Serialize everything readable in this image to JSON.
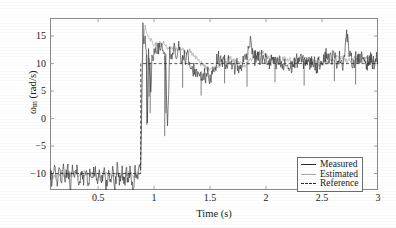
{
  "chart_data": {
    "type": "line",
    "title": "",
    "subtitle": "",
    "xlabel": "Time (s)",
    "ylabel": "ωm (rad/s)",
    "ylabel_base": "ω",
    "ylabel_sub": "m",
    "ylabel_unit": " (rad/s)",
    "xlim": [
      0.07,
      3.0
    ],
    "ylim": [
      -13.0,
      18.3
    ],
    "xticks": [
      0.5,
      1,
      1.5,
      2,
      2.5,
      3
    ],
    "xtick_labels": [
      "0.5",
      "1",
      "1.5",
      "2",
      "2.5",
      "3"
    ],
    "yticks": [
      15,
      10,
      5,
      0,
      -5,
      -10
    ],
    "ytick_labels": [
      "15",
      "10",
      "5",
      "0",
      "−5",
      "−10"
    ],
    "grid": false,
    "legend_position": "bottom-right",
    "colors": {
      "measured": "#2b2b2b",
      "estimated": "#a6a6a6",
      "reference": "#2b2b2b",
      "frame": "#8a8a8a",
      "background": "#ffffff"
    },
    "legend": [
      {
        "label": "Measured",
        "style": "solid-dark"
      },
      {
        "label": "Estimated",
        "style": "solid-light"
      },
      {
        "label": "Reference",
        "style": "dashed"
      }
    ],
    "annotations": [
      {
        "text": "step in speed reference from -10 to +10 rad/s at t = 0.88 s"
      }
    ],
    "series": [
      {
        "name": "Reference",
        "style": "dashed",
        "color": "#2b2b2b",
        "x": [
          0.07,
          0.879,
          0.881,
          3.0
        ],
        "values": [
          -10,
          -10,
          10,
          10
        ]
      },
      {
        "name": "Measured",
        "style": "solid",
        "color": "#2b2b2b",
        "note": "noisy speed measurement; oscillates about reference, large negative spikes just after step",
        "x": [
          0.07,
          0.09,
          0.11,
          0.13,
          0.15,
          0.17,
          0.19,
          0.21,
          0.23,
          0.25,
          0.27,
          0.29,
          0.31,
          0.33,
          0.35,
          0.37,
          0.39,
          0.41,
          0.43,
          0.45,
          0.47,
          0.49,
          0.51,
          0.53,
          0.55,
          0.57,
          0.59,
          0.61,
          0.63,
          0.65,
          0.67,
          0.69,
          0.71,
          0.73,
          0.75,
          0.77,
          0.79,
          0.81,
          0.83,
          0.85,
          0.87,
          0.88,
          0.89,
          0.9,
          0.91,
          0.92,
          0.93,
          0.94,
          0.95,
          0.96,
          0.97,
          0.98,
          0.99,
          1.0,
          1.02,
          1.04,
          1.06,
          1.08,
          1.1,
          1.12,
          1.14,
          1.16,
          1.18,
          1.2,
          1.22,
          1.24,
          1.26,
          1.28,
          1.3,
          1.32,
          1.34,
          1.36,
          1.38,
          1.4,
          1.42,
          1.44,
          1.46,
          1.48,
          1.5,
          1.52,
          1.54,
          1.56,
          1.58,
          1.6,
          1.62,
          1.64,
          1.66,
          1.68,
          1.7,
          1.72,
          1.74,
          1.76,
          1.78,
          1.8,
          1.82,
          1.84,
          1.86,
          1.88,
          1.9,
          1.92,
          1.94,
          1.96,
          1.98,
          2.0,
          2.03,
          2.06,
          2.09,
          2.12,
          2.15,
          2.18,
          2.21,
          2.24,
          2.27,
          2.3,
          2.33,
          2.36,
          2.39,
          2.42,
          2.45,
          2.48,
          2.51,
          2.54,
          2.57,
          2.6,
          2.63,
          2.66,
          2.69,
          2.72,
          2.75,
          2.78,
          2.81,
          2.84,
          2.87,
          2.9,
          2.93,
          2.96,
          3.0
        ],
        "values": [
          -9.5,
          -11.6,
          -9.2,
          -12.2,
          -9.0,
          -12.0,
          -9.4,
          -11.0,
          -8.8,
          -12.6,
          -9.3,
          -11.5,
          -9.0,
          -12.4,
          -9.6,
          -11.1,
          -8.7,
          -12.8,
          -9.4,
          -11.3,
          -8.9,
          -12.2,
          -9.1,
          -11.7,
          -8.8,
          -12.9,
          -9.5,
          -11.4,
          -8.9,
          -12.1,
          -9.2,
          -11.9,
          -8.7,
          -12.5,
          -9.4,
          -11.2,
          -9.0,
          -13.0,
          -9.6,
          -11.5,
          -9.2,
          -10.0,
          6.0,
          16.5,
          13.4,
          15.2,
          12.1,
          -1.0,
          11.6,
          8.4,
          4.2,
          11.0,
          9.2,
          12.4,
          13.2,
          12.2,
          13.6,
          12.5,
          11.4,
          -2.6,
          12.0,
          10.8,
          12.6,
          11.3,
          12.9,
          11.0,
          12.2,
          10.4,
          11.6,
          9.4,
          8.6,
          9.2,
          8.0,
          8.8,
          7.6,
          8.4,
          7.2,
          8.2,
          7.0,
          8.8,
          9.6,
          10.4,
          11.2,
          10.2,
          11.0,
          9.8,
          10.6,
          9.4,
          10.2,
          9.0,
          10.0,
          8.6,
          9.8,
          10.6,
          11.4,
          12.2,
          15.0,
          11.8,
          10.9,
          11.6,
          10.6,
          11.4,
          10.2,
          11.0,
          9.9,
          10.8,
          9.6,
          10.4,
          9.2,
          10.0,
          8.9,
          9.8,
          10.4,
          11.0,
          10.2,
          10.8,
          9.9,
          10.6,
          9.4,
          10.2,
          11.0,
          11.8,
          10.8,
          11.4,
          10.4,
          11.2,
          9.9,
          15.6,
          11.0,
          10.2,
          11.4,
          10.6,
          11.2,
          10.0,
          10.8,
          10.2,
          11.0
        ]
      },
      {
        "name": "Estimated",
        "style": "solid",
        "color": "#a6a6a6",
        "note": "sensorless estimate; smoother, tracks measured with small lag and overshoot after step",
        "x": [
          0.07,
          0.12,
          0.17,
          0.22,
          0.27,
          0.32,
          0.37,
          0.42,
          0.47,
          0.52,
          0.57,
          0.62,
          0.67,
          0.72,
          0.77,
          0.82,
          0.86,
          0.88,
          0.9,
          0.92,
          0.94,
          0.96,
          0.98,
          1.0,
          1.04,
          1.08,
          1.12,
          1.16,
          1.2,
          1.24,
          1.28,
          1.32,
          1.36,
          1.4,
          1.44,
          1.48,
          1.52,
          1.56,
          1.6,
          1.64,
          1.68,
          1.72,
          1.76,
          1.8,
          1.84,
          1.88,
          1.92,
          1.96,
          2.0,
          2.06,
          2.12,
          2.18,
          2.24,
          2.3,
          2.36,
          2.42,
          2.48,
          2.54,
          2.6,
          2.66,
          2.72,
          2.78,
          2.84,
          2.9,
          2.96,
          3.0
        ],
        "values": [
          -10.2,
          -10.6,
          -9.8,
          -10.4,
          -10.0,
          -10.5,
          -9.9,
          -10.3,
          -10.1,
          -10.6,
          -9.8,
          -10.4,
          -10.0,
          -10.5,
          -9.9,
          -10.3,
          -10.0,
          -9.8,
          13.0,
          16.8,
          15.4,
          14.6,
          14.0,
          13.6,
          13.4,
          13.8,
          13.0,
          13.2,
          12.6,
          12.8,
          12.0,
          12.3,
          11.5,
          10.4,
          9.6,
          9.0,
          8.6,
          9.2,
          10.0,
          10.6,
          11.0,
          10.4,
          10.0,
          9.6,
          10.2,
          11.0,
          11.6,
          12.0,
          11.4,
          11.0,
          10.6,
          11.0,
          10.4,
          10.8,
          10.2,
          10.6,
          10.0,
          10.4,
          10.8,
          11.2,
          10.6,
          11.0,
          10.4,
          10.8,
          10.4,
          10.9
        ]
      }
    ]
  }
}
